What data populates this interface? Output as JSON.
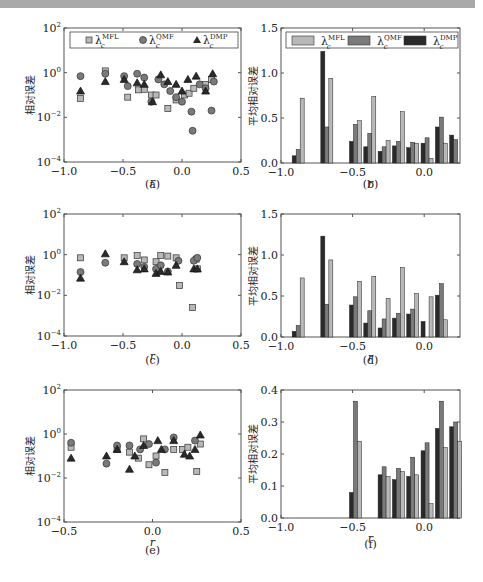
{
  "colors": {
    "mfl": "#b8b8b8",
    "qmf": "#7a7a7a",
    "dmp": "#2a2a2a",
    "axis": "#555555",
    "topbar": "#a9a9a9"
  },
  "legend": {
    "mfl": "λ",
    "mfl_sup": "MFL",
    "mfl_sub": "c",
    "qmf": "λ",
    "qmf_sup": "QMF",
    "qmf_sub": "c",
    "dmp": "λ",
    "dmp_sup": "DMP",
    "dmp_sub": "c"
  },
  "chart_data": [
    {
      "id": "a",
      "caption": "(a)",
      "type": "scatter",
      "xlabel": "r",
      "ylabel": "相对误差",
      "yscale": "log",
      "xlim": [
        -1.0,
        0.5
      ],
      "ylim": [
        0.0001,
        100
      ],
      "xticks": [
        "-1.0",
        "-0.5",
        "0.0",
        "0.5"
      ],
      "yticks": [
        "10^-4",
        "10^-2",
        "10^0",
        "10^2"
      ],
      "legend": [
        "λc^MFL",
        "λc^QMF",
        "λc^DMP"
      ],
      "series": [
        {
          "name": "MFL",
          "marker": "square",
          "points": [
            [
              -0.86,
              0.07
            ],
            [
              -0.65,
              1.2
            ],
            [
              -0.46,
              0.08
            ],
            [
              -0.37,
              0.17
            ],
            [
              -0.32,
              0.18
            ],
            [
              -0.26,
              0.1
            ],
            [
              -0.22,
              0.1
            ],
            [
              -0.12,
              0.025
            ],
            [
              -0.05,
              0.06
            ],
            [
              0.02,
              0.1
            ],
            [
              0.06,
              0.12
            ],
            [
              0.1,
              0.2
            ],
            [
              0.2,
              0.3
            ],
            [
              0.25,
              0.5
            ]
          ]
        },
        {
          "name": "QMF",
          "marker": "circle",
          "points": [
            [
              -0.86,
              0.7
            ],
            [
              -0.65,
              0.9
            ],
            [
              -0.49,
              0.7
            ],
            [
              -0.46,
              0.25
            ],
            [
              -0.38,
              0.9
            ],
            [
              -0.32,
              0.6
            ],
            [
              -0.26,
              0.05
            ],
            [
              -0.2,
              0.5
            ],
            [
              -0.15,
              0.3
            ],
            [
              -0.1,
              0.15
            ],
            [
              -0.05,
              0.08
            ],
            [
              0.0,
              0.05
            ],
            [
              0.08,
              0.018
            ],
            [
              0.09,
              0.0025
            ],
            [
              0.15,
              0.3
            ],
            [
              0.2,
              0.2
            ],
            [
              0.25,
              0.02
            ],
            [
              0.27,
              0.4
            ]
          ]
        },
        {
          "name": "DMP",
          "marker": "triangle",
          "points": [
            [
              -0.86,
              0.15
            ],
            [
              -0.65,
              0.4
            ],
            [
              -0.49,
              0.5
            ],
            [
              -0.38,
              0.35
            ],
            [
              -0.32,
              0.3
            ],
            [
              -0.25,
              0.05
            ],
            [
              -0.18,
              0.8
            ],
            [
              -0.12,
              0.4
            ],
            [
              -0.05,
              0.3
            ],
            [
              0.0,
              0.15
            ],
            [
              0.05,
              0.5
            ],
            [
              0.12,
              0.7
            ],
            [
              0.2,
              0.15
            ],
            [
              0.26,
              0.9
            ]
          ]
        }
      ]
    },
    {
      "id": "b",
      "caption": "(b)",
      "type": "bar",
      "xlabel": "r",
      "ylabel": "平均相对误差",
      "xlim": [
        -1.0,
        0.25
      ],
      "ylim": [
        0.0,
        1.5
      ],
      "xticks": [
        "-1.0",
        "-0.5",
        "0.0"
      ],
      "yticks": [
        "0.0",
        "0.5",
        "1.0",
        "1.5"
      ],
      "legend": [
        "λc^MFL",
        "λc^QMF",
        "λc^DMP"
      ],
      "categories": [
        -0.88,
        -0.68,
        -0.48,
        -0.38,
        -0.28,
        -0.18,
        -0.08,
        0.02,
        0.12,
        0.22
      ],
      "series": [
        {
          "name": "DMP",
          "values": [
            0.08,
            1.24,
            0.24,
            0.18,
            0.13,
            0.19,
            0.17,
            0.22,
            0.4,
            0.31
          ]
        },
        {
          "name": "QMF",
          "values": [
            0.15,
            0.4,
            0.43,
            0.33,
            0.18,
            0.24,
            0.23,
            0.28,
            0.51,
            0.26
          ]
        },
        {
          "name": "MFL",
          "values": [
            0.72,
            0.94,
            0.47,
            0.74,
            0.25,
            0.57,
            0.22,
            0.05,
            0.22,
            0.0
          ]
        }
      ]
    },
    {
      "id": "c",
      "caption": "(c)",
      "type": "scatter",
      "xlabel": "r",
      "ylabel": "相对误差",
      "yscale": "log",
      "xlim": [
        -1.0,
        0.5
      ],
      "ylim": [
        0.0001,
        100
      ],
      "xticks": [
        "-1.0",
        "-0.5",
        "0.0",
        "0.5"
      ],
      "yticks": [
        "10^-4",
        "10^-2",
        "10^0",
        "10^2"
      ],
      "series": [
        {
          "name": "MFL",
          "marker": "square",
          "points": [
            [
              -0.86,
              0.7
            ],
            [
              -0.49,
              0.7
            ],
            [
              -0.38,
              0.9
            ],
            [
              -0.32,
              0.55
            ],
            [
              -0.22,
              0.45
            ],
            [
              -0.18,
              0.9
            ],
            [
              -0.12,
              0.85
            ],
            [
              -0.05,
              0.7
            ],
            [
              -0.02,
              0.03
            ],
            [
              0.09,
              0.0025
            ],
            [
              0.13,
              0.2
            ],
            [
              0.12,
              0.6
            ]
          ]
        },
        {
          "name": "QMF",
          "marker": "circle",
          "points": [
            [
              -0.86,
              0.14
            ],
            [
              -0.65,
              0.4
            ],
            [
              -0.38,
              0.35
            ],
            [
              -0.32,
              0.25
            ],
            [
              -0.22,
              0.2
            ],
            [
              -0.18,
              0.3
            ],
            [
              -0.12,
              0.15
            ],
            [
              -0.03,
              0.5
            ],
            [
              0.1,
              0.5
            ],
            [
              0.13,
              0.7
            ]
          ]
        },
        {
          "name": "DMP",
          "marker": "triangle",
          "points": [
            [
              -0.86,
              0.07
            ],
            [
              -0.65,
              1.1
            ],
            [
              -0.49,
              0.45
            ],
            [
              -0.38,
              0.18
            ],
            [
              -0.32,
              0.2
            ],
            [
              -0.22,
              0.12
            ],
            [
              -0.18,
              0.15
            ],
            [
              -0.12,
              0.14
            ],
            [
              -0.05,
              0.3
            ],
            [
              0.1,
              0.2
            ],
            [
              0.13,
              0.2
            ]
          ]
        }
      ]
    },
    {
      "id": "d",
      "caption": "(d)",
      "type": "bar",
      "xlabel": "r",
      "ylabel": "平均相对误差",
      "xlim": [
        -1.0,
        0.25
      ],
      "ylim": [
        0.0,
        1.5
      ],
      "xticks": [
        "-1.0",
        "-0.5",
        "0.0"
      ],
      "yticks": [
        "0.0",
        "0.5",
        "1.0",
        "1.5"
      ],
      "categories": [
        -0.88,
        -0.68,
        -0.48,
        -0.38,
        -0.28,
        -0.18,
        -0.08,
        0.02,
        0.12
      ],
      "series": [
        {
          "name": "DMP",
          "values": [
            0.07,
            1.23,
            0.39,
            0.17,
            0.11,
            0.23,
            0.28,
            0.19,
            0.51
          ]
        },
        {
          "name": "QMF",
          "values": [
            0.14,
            0.4,
            0.49,
            0.32,
            0.22,
            0.29,
            0.34,
            0.0,
            0.65
          ]
        },
        {
          "name": "MFL",
          "values": [
            0.72,
            0.94,
            0.68,
            0.74,
            0.47,
            0.85,
            0.53,
            0.49,
            0.21
          ]
        }
      ]
    },
    {
      "id": "e",
      "caption": "(e)",
      "type": "scatter",
      "xlabel": "r",
      "ylabel": "相对误差",
      "yscale": "log",
      "xlim": [
        -0.5,
        0.5
      ],
      "ylim": [
        0.0001,
        100
      ],
      "xticks": [
        "-0.5",
        "0.0",
        "0.5"
      ],
      "yticks": [
        "10^-4",
        "10^-2",
        "10^0",
        "10^2"
      ],
      "series": [
        {
          "name": "MFL",
          "marker": "square",
          "points": [
            [
              -0.46,
              0.25
            ],
            [
              -0.2,
              0.2
            ],
            [
              -0.13,
              0.15
            ],
            [
              -0.08,
              0.08
            ],
            [
              -0.05,
              0.6
            ],
            [
              -0.02,
              0.04
            ],
            [
              0.02,
              0.1
            ],
            [
              0.07,
              0.018
            ],
            [
              0.12,
              0.2
            ],
            [
              0.17,
              0.2
            ],
            [
              0.2,
              0.25
            ],
            [
              0.25,
              0.02
            ],
            [
              0.27,
              0.35
            ]
          ]
        },
        {
          "name": "QMF",
          "marker": "circle",
          "points": [
            [
              -0.46,
              0.4
            ],
            [
              -0.26,
              0.045
            ],
            [
              -0.2,
              0.3
            ],
            [
              -0.13,
              0.3
            ],
            [
              -0.07,
              0.2
            ],
            [
              -0.02,
              0.35
            ],
            [
              0.02,
              0.05
            ],
            [
              0.07,
              0.2
            ],
            [
              0.12,
              0.7
            ],
            [
              0.24,
              0.5
            ]
          ]
        },
        {
          "name": "DMP",
          "marker": "triangle",
          "points": [
            [
              -0.46,
              0.08
            ],
            [
              -0.26,
              0.1
            ],
            [
              -0.2,
              0.2
            ],
            [
              -0.13,
              0.025
            ],
            [
              -0.1,
              0.1
            ],
            [
              -0.05,
              0.3
            ],
            [
              0.03,
              0.5
            ],
            [
              0.05,
              0.2
            ],
            [
              0.12,
              0.5
            ],
            [
              0.18,
              0.12
            ],
            [
              0.21,
              0.1
            ],
            [
              0.24,
              0.2
            ],
            [
              0.27,
              0.9
            ]
          ]
        }
      ]
    },
    {
      "id": "f",
      "caption": "(f)",
      "type": "bar",
      "xlabel": "r",
      "ylabel": "平均相对误差",
      "xlim": [
        -1.0,
        0.25
      ],
      "ylim": [
        0.0,
        0.4
      ],
      "xticks": [
        "-1.0",
        "-0.5",
        "0.0"
      ],
      "yticks": [
        "0.0",
        "0.1",
        "0.2",
        "0.3",
        "0.4"
      ],
      "categories": [
        -0.48,
        -0.28,
        -0.18,
        -0.08,
        0.02,
        0.12,
        0.22
      ],
      "series": [
        {
          "name": "DMP",
          "values": [
            0.08,
            0.135,
            0.12,
            0.13,
            0.21,
            0.28,
            0.285
          ]
        },
        {
          "name": "QMF",
          "values": [
            0.365,
            0.16,
            0.155,
            0.19,
            0.235,
            0.365,
            0.3
          ]
        },
        {
          "name": "MFL",
          "values": [
            0.24,
            0.13,
            0.145,
            0.135,
            0.045,
            0.22,
            0.24
          ]
        }
      ]
    }
  ]
}
